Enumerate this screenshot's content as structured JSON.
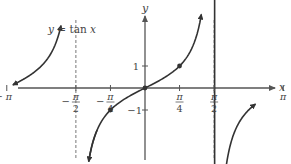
{
  "chart_data": {
    "type": "line",
    "title": "y = tan x",
    "legend_label": "y = tan x",
    "xlabel": "x",
    "ylabel": "y",
    "function": "tan",
    "xlim": [
      -5.6,
      5.6
    ],
    "ylim": [
      -3.4,
      3.8
    ],
    "grid": false,
    "asymptotes": [
      -4.712,
      -1.571,
      1.571,
      4.712
    ],
    "asymptote_labels": [
      "-3π/2",
      "-π/2",
      "π/2",
      "3π/2"
    ],
    "branches": [
      {
        "x_start": -3.0,
        "x_end": -1.91
      },
      {
        "x_start": -1.28,
        "x_end": 1.28
      },
      {
        "x_start": 1.42,
        "x_end": 2.51
      }
    ],
    "x_ticks": [
      {
        "value": -4.712,
        "num": "3π",
        "den": "2",
        "neg": true
      },
      {
        "value": -3.1416,
        "num": "π",
        "den": "",
        "neg": true
      },
      {
        "value": -1.571,
        "num": "π",
        "den": "2",
        "neg": true
      },
      {
        "value": -0.785,
        "num": "π",
        "den": "4",
        "neg": true
      },
      {
        "value": 0.785,
        "num": "π",
        "den": "4",
        "neg": false
      },
      {
        "value": 1.571,
        "num": "π",
        "den": "2",
        "neg": false
      },
      {
        "value": 3.1416,
        "num": "π",
        "den": "",
        "neg": false
      },
      {
        "value": 4.712,
        "num": "3π",
        "den": "2",
        "neg": false
      }
    ],
    "y_ticks": [
      {
        "value": 1,
        "label": "1"
      },
      {
        "value": -1,
        "label": "−1"
      }
    ],
    "points": [
      {
        "x": -0.785,
        "y": -1
      },
      {
        "x": 0,
        "y": 0
      },
      {
        "x": 0.785,
        "y": 1
      }
    ],
    "colors": {
      "curve": "#333333",
      "axis": "#555555",
      "asymptote": "#777777",
      "text": "#444444"
    }
  }
}
